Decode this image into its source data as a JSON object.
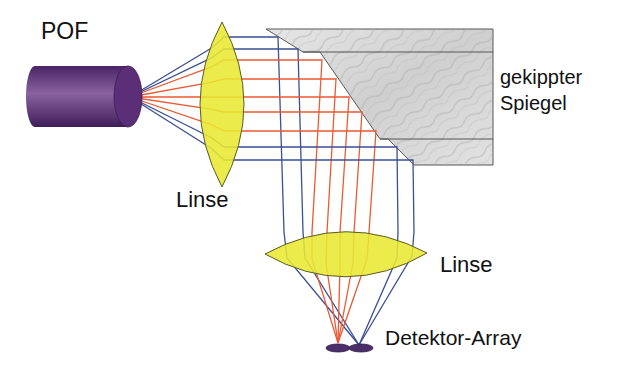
{
  "labels": {
    "fiber": "POF",
    "lens_upper": "Linse",
    "mirror_line1": "gekippter",
    "mirror_line2": "Spiegel",
    "lens_lower": "Linse",
    "detector": "Detektor-Array"
  },
  "colors": {
    "fiber": "#5a2f78",
    "lens_fill": "#e8e832",
    "lens_stroke": "#5b5b2a",
    "mirror_fill": "#d9d9d9",
    "mirror_stroke": "#555555",
    "ray_blue": "#3b4f93",
    "ray_red": "#ea5a34",
    "detector": "#4c2f6a"
  },
  "source": {
    "x": 130,
    "y": 97
  },
  "rays": [
    {
      "color": "blue",
      "y": 37,
      "mirror_x": 278,
      "lens_top_x": 284,
      "bend": [
        287,
        258
      ],
      "end": [
        359,
        345
      ]
    },
    {
      "color": "blue",
      "y": 49,
      "mirror_x": 298,
      "lens_top_x": 303,
      "bend": [
        305,
        258
      ],
      "end": [
        359,
        345
      ]
    },
    {
      "color": "red",
      "y": 60,
      "mirror_x": 322,
      "lens_top_x": 312,
      "bend": [
        312,
        259
      ],
      "end": [
        338,
        343
      ]
    },
    {
      "color": "red",
      "y": 79,
      "mirror_x": 336,
      "lens_top_x": 327,
      "bend": [
        326,
        263
      ],
      "end": [
        338,
        343
      ]
    },
    {
      "color": "red",
      "y": 97,
      "mirror_x": 349,
      "lens_top_x": 340,
      "bend": [
        340,
        265
      ],
      "end": [
        338,
        343
      ]
    },
    {
      "color": "red",
      "y": 112,
      "mirror_x": 362,
      "lens_top_x": 354,
      "bend": [
        353,
        263
      ],
      "end": [
        338,
        343
      ]
    },
    {
      "color": "red",
      "y": 131,
      "mirror_x": 376,
      "lens_top_x": 369,
      "bend": [
        367,
        259
      ],
      "end": [
        338,
        343
      ]
    },
    {
      "color": "blue",
      "y": 147,
      "mirror_x": 397,
      "lens_top_x": 398,
      "bend": [
        397,
        258
      ],
      "end": [
        359,
        345
      ]
    },
    {
      "color": "blue",
      "y": 160,
      "mirror_x": 413,
      "lens_top_x": 414,
      "bend": [
        412,
        256
      ],
      "end": [
        359,
        345
      ]
    }
  ]
}
